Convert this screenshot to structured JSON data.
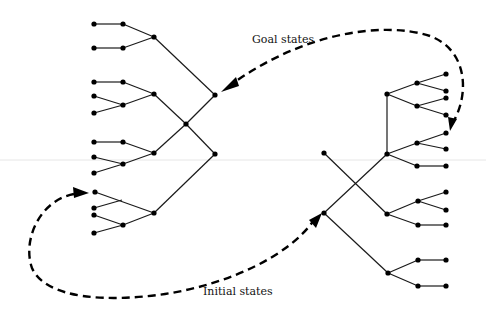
{
  "labels": {
    "goal": "Goal states",
    "initial": "Initial states"
  },
  "colors": {
    "ink": "#000000",
    "background": "#ffffff"
  },
  "left_tree": {
    "root": [
      186,
      124
    ],
    "branches": [
      {
        "node": [
          215,
          95
        ],
        "children": [
          {
            "node": [
              154,
              37
            ],
            "children": [
              {
                "inner": [
                  123,
                  24
                ],
                "leaves": [
                  [
                    94,
                    24
                  ]
                ]
              },
              {
                "inner": [
                  123,
                  48
                ],
                "leaves": [
                  [
                    94,
                    48
                  ]
                ]
              }
            ]
          },
          {
            "node": [
              154,
              94
            ],
            "children": [
              {
                "inner": [
                  123,
                  82
                ],
                "leaves": [
                  [
                    94,
                    82
                  ]
                ]
              },
              {
                "inner": [
                  123,
                  105
                ],
                "leaves": [
                  [
                    94,
                    96
                  ],
                  [
                    94,
                    113
                  ]
                ]
              }
            ]
          }
        ]
      },
      {
        "node": [
          154,
          153
        ],
        "children": [
          {
            "inner": [
              123,
              142
            ],
            "leaves": [
              [
                94,
                142
              ]
            ]
          },
          {
            "inner": [
              123,
              164
            ],
            "leaves": [
              [
                94,
                157
              ],
              [
                94,
                173
              ]
            ]
          }
        ]
      },
      {
        "node": [
          215,
          154
        ],
        "children": [
          {
            "node": [
              154,
              213
            ],
            "children": [
              {
                "inner": [
                  122,
                  200
                ],
                "leaves": [
                  [
                    95,
                    192
                  ],
                  [
                    94,
                    208
                  ]
                ]
              },
              {
                "inner": [
                  123,
                  225
                ],
                "leaves": [
                  [
                    94,
                    215
                  ],
                  [
                    94,
                    233
                  ]
                ]
              }
            ]
          }
        ]
      }
    ]
  },
  "right_tree": {
    "nodes": [
      "(324,153)",
      "(324,213)",
      "(387,94)",
      "(387,154)",
      "(387,214)",
      "(388,273)"
    ]
  }
}
